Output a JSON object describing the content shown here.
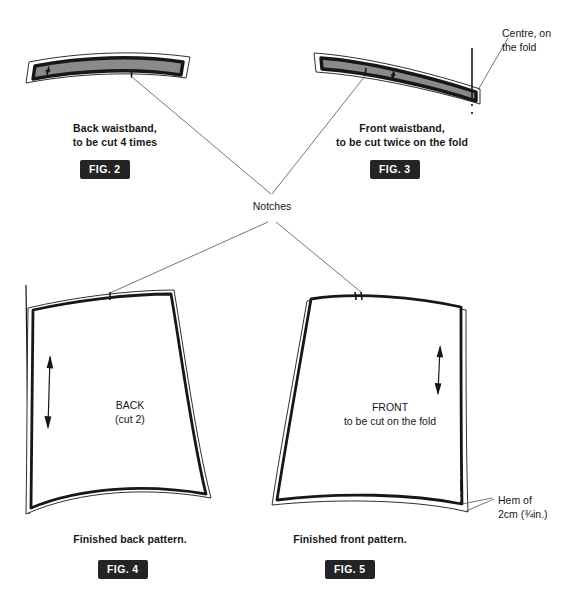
{
  "figure": {
    "background_color": "#ffffff",
    "ink_color": "#171717",
    "fabric_fill_color": "#8a8a8a",
    "tag_background_color": "#242424",
    "tag_text_color": "#ffffff"
  },
  "annotations": {
    "centre_fold": "Centre, on\nthe fold",
    "notches": "Notches",
    "hem": "Hem of\n2cm (¾in.)"
  },
  "panels": [
    {
      "id": "back-waistband",
      "caption": "Back waistband,\nto be cut 4 times",
      "fig_tag": "FIG. 2"
    },
    {
      "id": "front-waistband",
      "caption": "Front waistband,\nto be cut twice on the fold",
      "fig_tag": "FIG. 3"
    },
    {
      "id": "back-pattern",
      "piece_label": "BACK\n(cut 2)",
      "caption": "Finished back pattern.",
      "fig_tag": "FIG. 4"
    },
    {
      "id": "front-pattern",
      "piece_label": "FRONT\nto be cut on the fold",
      "caption": "Finished front pattern.",
      "fig_tag": "FIG. 5"
    }
  ]
}
